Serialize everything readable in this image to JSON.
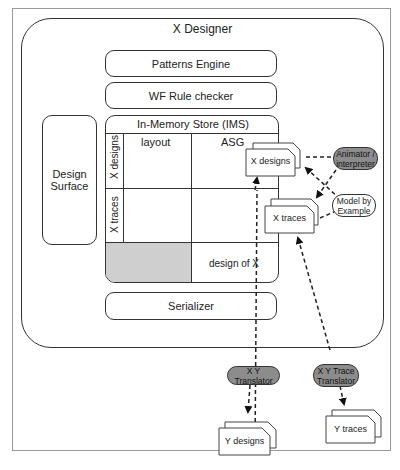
{
  "diagram": {
    "container_title": "X Designer",
    "components": {
      "patterns_engine": "Patterns Engine",
      "wf_rule_checker": "WF Rule checker",
      "design_surface": "Design Surface",
      "serializer": "Serializer"
    },
    "ims": {
      "title": "In-Memory Store (IMS)",
      "columns": [
        "layout",
        "ASG"
      ],
      "rows": [
        "X designs",
        "X traces"
      ],
      "bottom_cell": "design of X"
    },
    "documents": {
      "x_designs": "X designs",
      "x_traces": "X traces",
      "y_designs": "Y designs",
      "y_traces": "Y traces"
    },
    "external_nodes": {
      "animator": "Animator / interpreter",
      "model_by_example": "Model by Example",
      "xy_translator": "X Y Translator",
      "xy_trace_translator": "X Y  Trace Translator"
    },
    "colors": {
      "line": "#333333",
      "shaded_cell": "#cfcfcf",
      "dark_node": "#8c8c8c",
      "frame": "#9a9a9a"
    }
  }
}
